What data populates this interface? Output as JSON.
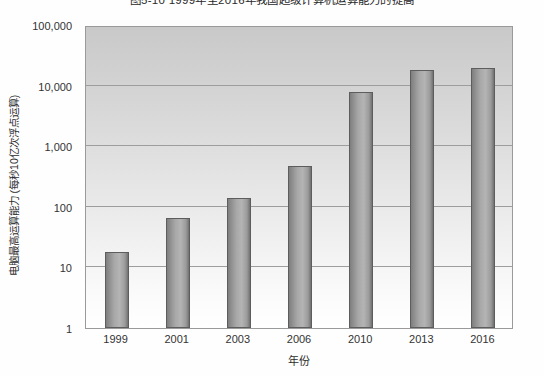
{
  "chart_data": {
    "type": "bar",
    "title": "图5-10  1999年至2016年我国超级计算机运算能力的提高",
    "xlabel": "年份",
    "ylabel": "电脑最高运算能力 (每秒10亿次浮点运算)",
    "categories": [
      "1999",
      "2001",
      "2003",
      "2006",
      "2010",
      "2013",
      "2016"
    ],
    "values": [
      18,
      65,
      140,
      480,
      7900,
      18000,
      19500
    ],
    "yscale": "log",
    "ylim": [
      1,
      100000
    ],
    "ytick_labels": [
      "100,000",
      "10,000",
      "1,000",
      "100",
      "10",
      "1"
    ],
    "ytick_values": [
      100000,
      10000,
      1000,
      100,
      10,
      1
    ],
    "grid": true,
    "legend": "none",
    "bar_color": "#a8a8a8",
    "bar_border_color": "#5d5d5d",
    "plot_border_color": "#9a9a9a",
    "gridline_color": "#9d9d9d",
    "background_color": "#ffffff"
  }
}
